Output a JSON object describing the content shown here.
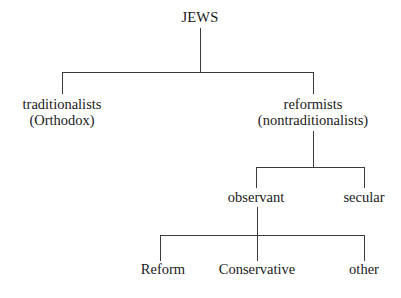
{
  "diagram": {
    "type": "tree-diagram",
    "background_color": "#ffffff",
    "line_color": "#3b3b3b",
    "text_color": "#1a1a1a",
    "nodes": {
      "root": {
        "label": "JEWS"
      },
      "traditionalists": {
        "line1": "traditionalists",
        "line2": "(Orthodox)"
      },
      "reformists": {
        "line1": "reformists",
        "line2": "(nontraditionalists)"
      },
      "observant": {
        "label": "observant"
      },
      "secular": {
        "label": "secular"
      },
      "reform": {
        "label": "Reform"
      },
      "conservative": {
        "label": "Conservative"
      },
      "other": {
        "label": "other"
      }
    }
  }
}
